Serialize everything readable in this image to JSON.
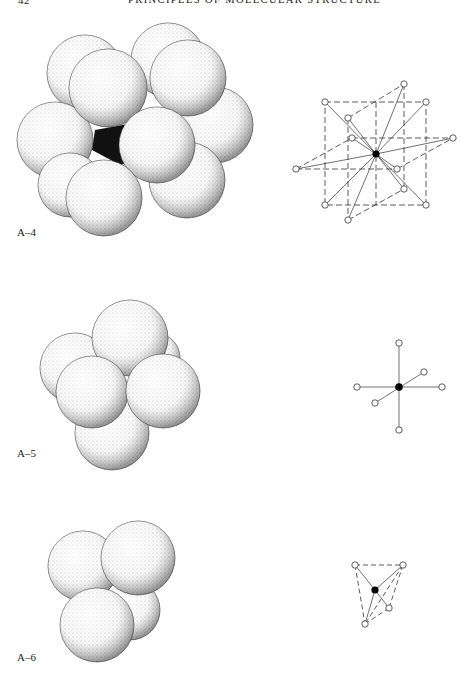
{
  "page": {
    "page_number": "42",
    "running_title": "PRINCIPLES OF MOLECULAR STRUCTURE"
  },
  "figures": [
    {
      "id": "A-4",
      "label": "A–4",
      "model": "space-filling cluster of 12 spheres around a central atom (cuboctahedral/close-packed coordination)",
      "diagram": "ball-and-stick with dashed cube frame, 12 ligands bonded to dark central atom",
      "coordination_number": 12
    },
    {
      "id": "A-5",
      "label": "A–5",
      "model": "space-filling cluster of 6 spheres (octahedral)",
      "diagram": "octahedral ball-and-stick, 6 ligands on 3 axes through dark central atom",
      "coordination_number": 6
    },
    {
      "id": "A-6",
      "label": "A–6",
      "model": "space-filling cluster of 4 spheres (tetrahedral)",
      "diagram": "tetrahedral ball-and-stick with dashed edges, 4 ligands around dark central atom",
      "coordination_number": 4
    }
  ],
  "colors": {
    "ink": "#1a1a1a",
    "paper": "#ffffff",
    "sphere_fill": "#f4f4f4",
    "central_atom": "#000000"
  }
}
